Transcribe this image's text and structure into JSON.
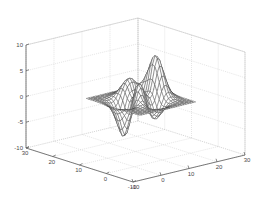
{
  "figure": {
    "title": "",
    "background_color": "#ffffff",
    "axis_line_color": "#595959",
    "grid_color": "#c8c8c8",
    "mesh_color": "#3a3a3a",
    "tick_label_color": "#4a4a4a"
  },
  "chart_data": {
    "type": "line",
    "plot_style": "3d-mesh-wireframe",
    "title": "",
    "xlabel": "",
    "ylabel": "",
    "zlabel": "",
    "grid": true,
    "legend": "none",
    "projection": "3d-isometric",
    "function": "peaks",
    "surface_description": "MATLAB peaks function rendered as a wireframe mesh surface with a tall positive peak on the left, a smaller secondary peak in the middle, a flat plateau on the right and a deep negative well in the right-front region.",
    "xaxis": {
      "label": "",
      "ticks": [
        -10,
        0,
        10,
        20,
        30
      ],
      "tick_labels": [
        "-10",
        "0",
        "10",
        "20",
        "30"
      ],
      "lim": [
        -10,
        30
      ],
      "position": "bottom-right"
    },
    "yaxis": {
      "label": "",
      "ticks": [
        30,
        20,
        10,
        0,
        -10
      ],
      "tick_labels": [
        "30",
        "20",
        "10",
        "0",
        "-10"
      ],
      "lim": [
        -10,
        30
      ],
      "position": "bottom-left"
    },
    "zaxis": {
      "label": "",
      "ticks": [
        10,
        5,
        0,
        -5,
        -10
      ],
      "tick_labels": [
        "10",
        "5",
        "0",
        "-5",
        "-10"
      ],
      "lim": [
        -10,
        10
      ],
      "position": "left"
    },
    "data_extent": {
      "z_max": 8.1,
      "z_min": -6.5,
      "grid_rows": 25,
      "grid_cols": 25
    }
  }
}
